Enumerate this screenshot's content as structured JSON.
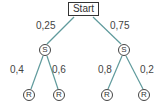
{
  "diagram": {
    "type": "probability-tree",
    "root": {
      "label": "Start"
    },
    "level1": [
      {
        "label": "S",
        "edge_prob": "0,25"
      },
      {
        "label": "S",
        "edge_prob": "0,75"
      }
    ],
    "level2": [
      {
        "label": "R",
        "edge_prob": "0,4"
      },
      {
        "label": "R",
        "edge_prob": "0,6"
      },
      {
        "label": "R",
        "edge_prob": "0,8"
      },
      {
        "label": "R",
        "edge_prob": "0,2"
      }
    ],
    "colors": {
      "edge": "#5f9a9c",
      "node_border": "#444444",
      "text": "#444444"
    }
  }
}
